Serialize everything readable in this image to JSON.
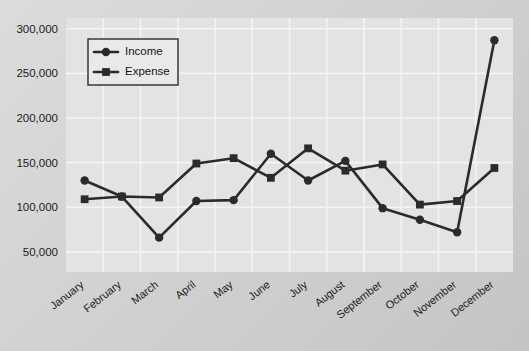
{
  "chart_data": {
    "type": "line",
    "title": "",
    "xlabel": "",
    "ylabel": "",
    "categories": [
      "January",
      "February",
      "March",
      "April",
      "May",
      "June",
      "July",
      "August",
      "September",
      "October",
      "November",
      "December"
    ],
    "series": [
      {
        "name": "Income",
        "marker": "circle",
        "color": "#2b2b2b",
        "values": [
          130000,
          112000,
          66000,
          107000,
          108000,
          160000,
          130000,
          152000,
          99000,
          86000,
          72000,
          287000
        ]
      },
      {
        "name": "Expense",
        "marker": "square",
        "color": "#2b2b2b",
        "values": [
          109000,
          112000,
          111000,
          149000,
          155000,
          133000,
          166000,
          141000,
          148000,
          103000,
          107000,
          144000
        ]
      }
    ],
    "ylim": [
      27500,
      312000
    ],
    "yticks": [
      50000,
      100000,
      150000,
      200000,
      250000,
      300000
    ],
    "ytick_labels": [
      "50,000",
      "100,000",
      "150,000",
      "200,000",
      "250,000",
      "300,000"
    ],
    "grid": true,
    "legend_position": "upper-left-inside"
  },
  "legend": {
    "entries": [
      {
        "label": "Income",
        "marker": "circle"
      },
      {
        "label": "Expense",
        "marker": "square"
      }
    ]
  },
  "colors": {
    "line": "#2b2b2b",
    "plot_background": "#e3e3e3",
    "gridline": "#f4f4f4",
    "page_background": "#d4d4d4",
    "text": "#1c1c1c"
  }
}
